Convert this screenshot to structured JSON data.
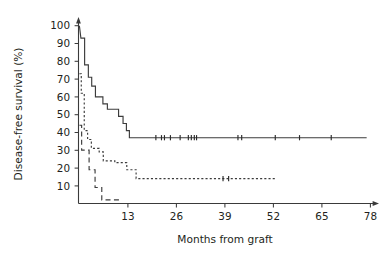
{
  "chart_data": {
    "type": "line",
    "title": "",
    "xlabel": "Months from graft",
    "ylabel": "Disease-free survival (%)",
    "xlim": [
      0,
      80
    ],
    "ylim": [
      0,
      105
    ],
    "xticks": [
      13,
      26,
      39,
      52,
      65,
      78
    ],
    "yticks": [
      10,
      20,
      30,
      40,
      50,
      60,
      70,
      80,
      90,
      100
    ],
    "grid": false,
    "legend": "none",
    "curve_style": "kaplan-meier step",
    "series": [
      {
        "name": "curve-1-solid",
        "style": "solid",
        "steps": [
          {
            "x": 0.0,
            "y": 100
          },
          {
            "x": 0.4,
            "y": 93
          },
          {
            "x": 1.4,
            "y": 93
          },
          {
            "x": 1.4,
            "y": 78
          },
          {
            "x": 2.4,
            "y": 78
          },
          {
            "x": 2.4,
            "y": 71
          },
          {
            "x": 3.3,
            "y": 71
          },
          {
            "x": 3.3,
            "y": 66
          },
          {
            "x": 4.3,
            "y": 66
          },
          {
            "x": 4.3,
            "y": 60
          },
          {
            "x": 6.3,
            "y": 60
          },
          {
            "x": 6.3,
            "y": 56
          },
          {
            "x": 7.5,
            "y": 56
          },
          {
            "x": 7.5,
            "y": 53
          },
          {
            "x": 10.5,
            "y": 53
          },
          {
            "x": 10.5,
            "y": 49
          },
          {
            "x": 11.7,
            "y": 49
          },
          {
            "x": 11.7,
            "y": 45
          },
          {
            "x": 12.6,
            "y": 45
          },
          {
            "x": 12.6,
            "y": 41
          },
          {
            "x": 13.4,
            "y": 41
          },
          {
            "x": 13.4,
            "y": 37
          },
          {
            "x": 77.0,
            "y": 37
          }
        ],
        "censor_marks_x": [
          20.5,
          22.0,
          22.8,
          24.4,
          27.0,
          29.2,
          30.0,
          30.8,
          31.4,
          42.5,
          43.5,
          52.5,
          59.0,
          67.5
        ],
        "plateau_value": 37
      },
      {
        "name": "curve-2-dotted",
        "style": "dotted",
        "steps": [
          {
            "x": 0.0,
            "y": 73
          },
          {
            "x": 0.5,
            "y": 73
          },
          {
            "x": 0.5,
            "y": 62
          },
          {
            "x": 1.3,
            "y": 62
          },
          {
            "x": 1.3,
            "y": 41
          },
          {
            "x": 2.2,
            "y": 41
          },
          {
            "x": 2.2,
            "y": 36
          },
          {
            "x": 3.2,
            "y": 36
          },
          {
            "x": 3.2,
            "y": 31
          },
          {
            "x": 5.3,
            "y": 31
          },
          {
            "x": 5.3,
            "y": 29
          },
          {
            "x": 6.4,
            "y": 29
          },
          {
            "x": 6.4,
            "y": 24
          },
          {
            "x": 9.5,
            "y": 24
          },
          {
            "x": 9.5,
            "y": 23
          },
          {
            "x": 12.7,
            "y": 23
          },
          {
            "x": 12.7,
            "y": 19
          },
          {
            "x": 15.2,
            "y": 19
          },
          {
            "x": 15.2,
            "y": 14
          },
          {
            "x": 52.5,
            "y": 14
          }
        ],
        "censor_marks_x": [
          38.5,
          40.0
        ],
        "plateau_value": 14
      },
      {
        "name": "curve-3-dashed",
        "style": "dashed",
        "steps": [
          {
            "x": 0.0,
            "y": 44
          },
          {
            "x": 0.6,
            "y": 44
          },
          {
            "x": 0.6,
            "y": 30
          },
          {
            "x": 2.6,
            "y": 30
          },
          {
            "x": 2.6,
            "y": 19
          },
          {
            "x": 4.2,
            "y": 19
          },
          {
            "x": 4.2,
            "y": 9
          },
          {
            "x": 6.0,
            "y": 9
          },
          {
            "x": 6.0,
            "y": 2
          },
          {
            "x": 11.5,
            "y": 2
          }
        ],
        "censor_marks_x": [],
        "plateau_value": 2
      }
    ]
  },
  "axes": {
    "y_title": "Disease-free survival (%)",
    "x_title": "Months from graft",
    "y_tick_labels": [
      "100",
      "90",
      "80",
      "70",
      "60",
      "50",
      "40",
      "30",
      "20",
      "10"
    ],
    "x_tick_labels": [
      "13",
      "26",
      "39",
      "52",
      "65",
      "78"
    ]
  },
  "colors": {
    "background": "#ffffff",
    "axis": "#3a3a3a",
    "curve": "#3c3c3c",
    "text": "#231f20"
  }
}
